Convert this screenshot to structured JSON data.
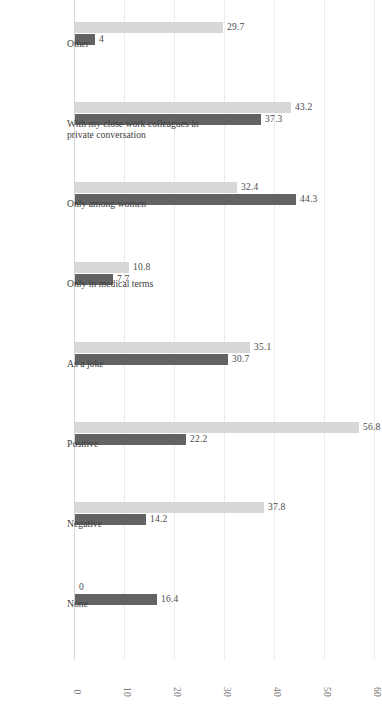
{
  "chart_data": {
    "type": "bar",
    "title": "",
    "subtitle": "",
    "xlabel": "",
    "ylabel": "",
    "ylim": [
      0,
      60
    ],
    "yticks": [
      "0",
      "10",
      "20",
      "30",
      "40",
      "50",
      "60"
    ],
    "grid": true,
    "orientation": "rotated-90",
    "legend_position": "bottom-right",
    "categories": [
      "Other",
      "With my close work colleagues in private conversation",
      "Only among women",
      "Only in medical terms",
      "As a joke",
      "Positive",
      "Negative",
      "None"
    ],
    "category_lines": [
      [
        "Other"
      ],
      [
        "With my close work colleagues in",
        "private conversation"
      ],
      [
        "Only among women"
      ],
      [
        "Only in medical terms"
      ],
      [
        "As a joke"
      ],
      [
        "Positive"
      ],
      [
        "Negative"
      ],
      [
        "None"
      ]
    ],
    "series": [
      {
        "name": "Post-workshop survey",
        "color": "#d8d8d8",
        "values": [
          29.7,
          43.2,
          32.4,
          10.8,
          35.1,
          56.8,
          37.8,
          0
        ],
        "labels": [
          "29.7",
          "43.2",
          "32.4",
          "10.8",
          "35.1",
          "56.8",
          "37.8",
          "0"
        ]
      },
      {
        "name": "Baseline survey",
        "color": "#636363",
        "values": [
          4,
          37.3,
          44.3,
          7.7,
          30.7,
          22.2,
          14.2,
          16.4
        ],
        "labels": [
          "4",
          "37.3",
          "44.3",
          "7.7",
          "30.7",
          "22.2",
          "14.2",
          "16.4"
        ]
      }
    ]
  },
  "legend": {
    "items": [
      {
        "label": "Post-workshop survey",
        "color": "#d8d8d8"
      },
      {
        "label": "Baseline survey",
        "color": "#636363"
      }
    ]
  }
}
